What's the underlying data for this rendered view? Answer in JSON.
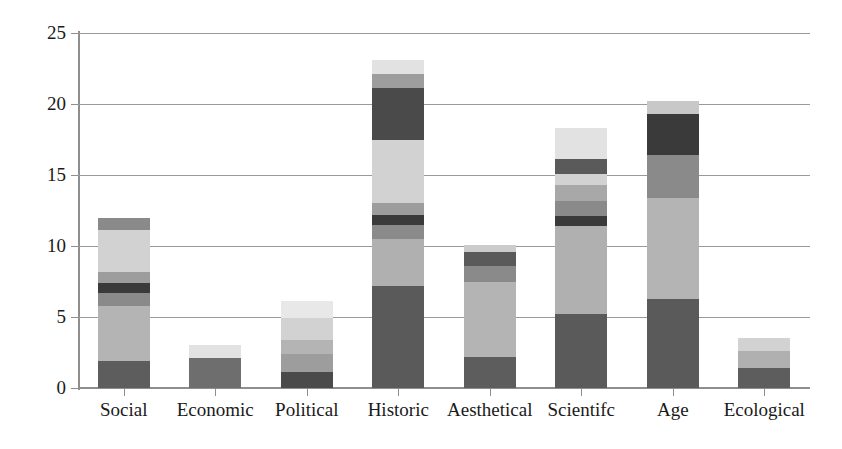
{
  "chart_data": {
    "type": "bar",
    "subtype": "stacked-bar",
    "title": "",
    "xlabel": "",
    "ylabel": "",
    "ylim": [
      0,
      25
    ],
    "yticks": [
      0,
      5,
      10,
      15,
      20,
      25
    ],
    "ytick_labels": [
      "0",
      "5",
      "10",
      "15",
      "20",
      "25"
    ],
    "grid": true,
    "grid_axis": "y",
    "legend": false,
    "legend_position": "none",
    "categories": [
      "Social",
      "Economic",
      "Political",
      "Historic",
      "Aesthetical",
      "Scientifc",
      "Age",
      "Ecological"
    ],
    "totals": [
      12.0,
      3.0,
      6.1,
      23.1,
      10.1,
      18.2,
      20.2,
      3.5
    ],
    "series": [
      {
        "name": "Segment 1",
        "color": "#5d5d5d",
        "values": [
          1.9,
          2.1,
          1.1,
          7.2,
          2.2,
          5.2,
          6.3,
          1.4
        ]
      },
      {
        "name": "Segment 2",
        "color": "#b4b4b4",
        "values": [
          3.9,
          0.0,
          1.3,
          3.3,
          5.3,
          6.2,
          7.1,
          1.2
        ]
      },
      {
        "name": "Segment 3",
        "color": "#8a8a8a",
        "values": [
          0.9,
          0.0,
          1.0,
          1.0,
          0.0,
          0.7,
          0.0,
          0.0
        ]
      },
      {
        "name": "Segment 4",
        "color": "#3a3a3a",
        "values": [
          0.7,
          0.0,
          0.0,
          0.7,
          0.0,
          0.9,
          3.0,
          0.0
        ]
      },
      {
        "name": "Segment 5",
        "color": "#9d9d9d",
        "values": [
          0.8,
          0.0,
          0.0,
          0.8,
          1.1,
          1.1,
          0.0,
          0.0
        ]
      },
      {
        "name": "Segment 6",
        "color": "#d2d2d2",
        "values": [
          2.9,
          0.0,
          1.5,
          4.5,
          0.0,
          1.1,
          0.0,
          0.0
        ]
      },
      {
        "name": "Segment 7",
        "color": "#4a4a4a",
        "values": [
          0.0,
          0.0,
          0.0,
          3.6,
          1.0,
          0.0,
          2.9,
          0.0
        ]
      },
      {
        "name": "Segment 8",
        "color": "#9d9d9d",
        "values": [
          0.9,
          0.0,
          0.0,
          1.0,
          0.5,
          0.8,
          0.9,
          0.0
        ]
      },
      {
        "name": "Segment 9",
        "color": "#e2e2e2",
        "values": [
          0.0,
          0.9,
          1.2,
          1.0,
          0.0,
          2.2,
          0.0,
          0.9
        ]
      }
    ],
    "stack_order": [
      {
        "category": "Social",
        "segments": [
          {
            "value": 1.9,
            "color": "#5d5d5d"
          },
          {
            "value": 3.9,
            "color": "#b4b4b4"
          },
          {
            "value": 0.9,
            "color": "#8a8a8a"
          },
          {
            "value": 0.7,
            "color": "#3a3a3a"
          },
          {
            "value": 0.8,
            "color": "#9d9d9d"
          },
          {
            "value": 2.9,
            "color": "#d2d2d2"
          },
          {
            "value": 0.9,
            "color": "#8a8a8a"
          }
        ]
      },
      {
        "category": "Economic",
        "segments": [
          {
            "value": 2.1,
            "color": "#6e6e6e"
          },
          {
            "value": 0.9,
            "color": "#e2e2e2"
          }
        ]
      },
      {
        "category": "Political",
        "segments": [
          {
            "value": 1.1,
            "color": "#4a4a4a"
          },
          {
            "value": 1.3,
            "color": "#9d9d9d"
          },
          {
            "value": 1.0,
            "color": "#b4b4b4"
          },
          {
            "value": 1.5,
            "color": "#d2d2d2"
          },
          {
            "value": 1.2,
            "color": "#e8e8e8"
          }
        ]
      },
      {
        "category": "Historic",
        "segments": [
          {
            "value": 7.2,
            "color": "#5a5a5a"
          },
          {
            "value": 3.3,
            "color": "#b0b0b0"
          },
          {
            "value": 1.0,
            "color": "#8a8a8a"
          },
          {
            "value": 0.7,
            "color": "#3a3a3a"
          },
          {
            "value": 0.8,
            "color": "#9d9d9d"
          },
          {
            "value": 4.5,
            "color": "#d2d2d2"
          },
          {
            "value": 3.6,
            "color": "#4a4a4a"
          },
          {
            "value": 1.0,
            "color": "#9d9d9d"
          },
          {
            "value": 1.0,
            "color": "#e2e2e2"
          }
        ]
      },
      {
        "category": "Aesthetical",
        "segments": [
          {
            "value": 2.2,
            "color": "#5d5d5d"
          },
          {
            "value": 5.3,
            "color": "#b4b4b4"
          },
          {
            "value": 1.1,
            "color": "#8a8a8a"
          },
          {
            "value": 1.0,
            "color": "#5a5a5a"
          },
          {
            "value": 0.5,
            "color": "#cccccc"
          }
        ]
      },
      {
        "category": "Scientifc",
        "segments": [
          {
            "value": 5.2,
            "color": "#5a5a5a"
          },
          {
            "value": 6.2,
            "color": "#b0b0b0"
          },
          {
            "value": 0.7,
            "color": "#3a3a3a"
          },
          {
            "value": 1.1,
            "color": "#8a8a8a"
          },
          {
            "value": 1.1,
            "color": "#a8a8a8"
          },
          {
            "value": 0.8,
            "color": "#d2d2d2"
          },
          {
            "value": 1.0,
            "color": "#5a5a5a"
          },
          {
            "value": 2.2,
            "color": "#e2e2e2"
          }
        ]
      },
      {
        "category": "Age",
        "segments": [
          {
            "value": 6.3,
            "color": "#5a5a5a"
          },
          {
            "value": 7.1,
            "color": "#b4b4b4"
          },
          {
            "value": 3.0,
            "color": "#8a8a8a"
          },
          {
            "value": 2.9,
            "color": "#3a3a3a"
          },
          {
            "value": 0.9,
            "color": "#c8c8c8"
          }
        ]
      },
      {
        "category": "Ecological",
        "segments": [
          {
            "value": 1.4,
            "color": "#5d5d5d"
          },
          {
            "value": 1.2,
            "color": "#b0b0b0"
          },
          {
            "value": 0.9,
            "color": "#d2d2d2"
          }
        ]
      }
    ]
  },
  "axis": {
    "y_labels": [
      "0",
      "5",
      "10",
      "15",
      "20",
      "25"
    ]
  },
  "colors": {
    "axis": "#8e8e8e",
    "grid": "#9a9a9a",
    "text": "#1a1a1a",
    "background": "#ffffff"
  }
}
